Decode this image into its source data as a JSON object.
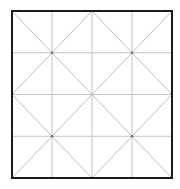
{
  "diagram": {
    "type": "grid-with-diagonals",
    "frame": {
      "x": 12,
      "y": 11,
      "width": 160,
      "height": 167
    },
    "columns": 4,
    "rows": 4,
    "colors": {
      "frame": "#1a1a1a",
      "grid": "#c4c4c4",
      "diagonal": "#bdbdbd",
      "node": "#707070",
      "background": "#ffffff"
    }
  }
}
